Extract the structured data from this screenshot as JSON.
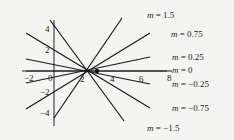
{
  "diagram": {
    "point": {
      "x": 3,
      "y": 0
    },
    "x_axis": {
      "ticks": [
        -2,
        0,
        2,
        4,
        6,
        8
      ],
      "tick_labels": [
        "−2",
        "0",
        "2",
        "4",
        "6",
        "8"
      ]
    },
    "y_axis": {
      "ticks": [
        4,
        2,
        -2,
        -4
      ],
      "tick_labels": [
        "4",
        "2",
        "−2",
        "−4"
      ]
    },
    "lines": [
      {
        "m": 1.5,
        "var": "m",
        "eq": " = 1.5"
      },
      {
        "m": 0.75,
        "var": "m",
        "eq": " = 0.75"
      },
      {
        "m": 0.25,
        "var": "m",
        "eq": " = 0.25"
      },
      {
        "m": 0,
        "var": "m",
        "eq": " = 0"
      },
      {
        "m": -0.25,
        "var": "m",
        "eq": " = −0.25"
      },
      {
        "m": -0.75,
        "var": "m",
        "eq": " = −0.75"
      },
      {
        "m": -1.5,
        "var": "m",
        "eq": " = −1.5"
      }
    ]
  }
}
